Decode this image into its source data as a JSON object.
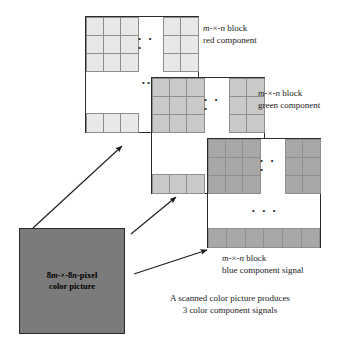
{
  "figure": {
    "title": "A scanned color picture produces 3 color component signals",
    "background_color": "#ffffff",
    "line_color": "#2b2b2b",
    "cell_border_color": "#8e8e8e"
  },
  "source": {
    "label_line1": "8m-×-8n-pixel",
    "label_line2": "color picture",
    "fill_color": "#7b7b7b",
    "border_color": "#2b2b2b"
  },
  "components": [
    {
      "id": "red",
      "label_line1": "m-×-n block",
      "label_line2": "red component",
      "cell_color": "#e8e8e6",
      "rows": 3,
      "cols_left": 3,
      "cols_right": 2,
      "bottom_cells": 3,
      "h_dots": "• • •",
      "v_dots": "• •",
      "bottom_dots": "• • •"
    },
    {
      "id": "green",
      "label_line1": "m-×-n block",
      "label_line2": "green component",
      "cell_color": "#c9c9c7",
      "rows": 3,
      "cols_left": 3,
      "cols_right": 2,
      "bottom_cells": 3,
      "h_dots": "• • •",
      "v_dots": "• •",
      "bottom_dots": "• • •"
    },
    {
      "id": "blue",
      "label_line1": "m-×-n block",
      "label_line2": "blue component signal",
      "cell_color": "#a8a8a6",
      "rows": 3,
      "cols_left": 3,
      "cols_right": 2,
      "bottom_cells": 6,
      "h_dots": "• • •",
      "v_dots": "• •",
      "bottom_dots": "• • •"
    }
  ],
  "caption": {
    "line1": "A scanned color picture produces",
    "line2": "3 color component signals"
  },
  "arrows": [
    {
      "name": "arrow-to-red",
      "x1": 33,
      "y1": 228,
      "x2": 123,
      "y2": 146
    },
    {
      "name": "arrow-to-green",
      "x1": 131,
      "y1": 234,
      "x2": 177,
      "y2": 197
    },
    {
      "name": "arrow-to-blue",
      "x1": 134,
      "y1": 274,
      "x2": 208,
      "y2": 250
    }
  ]
}
